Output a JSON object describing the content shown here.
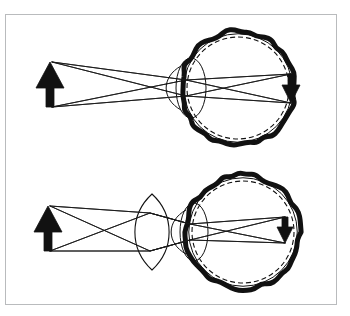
{
  "figure": {
    "title": "Optical ray diagram of the human eye: uncorrected hyperopia and convex-lens correction",
    "caption": "",
    "background_color": "#ffffff",
    "frame": {
      "stroke_color": "#b9bbbd",
      "stroke_width": 1,
      "x": 5,
      "y": 14,
      "width": 332,
      "height": 291
    },
    "ink_color": "#111111",
    "ray_color": "#1a1a1a",
    "dashed_color": "#111111"
  },
  "panels": [
    {
      "id": "panel-top",
      "name": "uncorrected-eye-panel",
      "label": "Uncorrected eye",
      "has_external_lens": false,
      "object_arrow": {
        "name": "object-arrow",
        "orientation": "upright",
        "tip_x": 50,
        "tip_y": 62,
        "base_x": 50,
        "base_y": 107,
        "head_half_width": 14,
        "head_height": 26,
        "shaft_half_width": 4,
        "color": "#111111"
      },
      "eyeball": {
        "name": "eyeball",
        "center_x": 238,
        "center_y": 88,
        "radius": 57,
        "sclera_thickness": 5,
        "sclera_color": "#111111",
        "retina_dash_inset": 6,
        "retina_dash_pattern": "5,3",
        "cornea_bulge_x": 181,
        "cornea_bulge_rx": 9,
        "cornea_bulge_ry": 22
      },
      "crystalline_lens": {
        "name": "crystalline-lens",
        "center_x": 191,
        "center_y": 88,
        "rx": 15,
        "ry": 30
      },
      "image_arrow": {
        "name": "image-arrow",
        "orientation": "inverted",
        "tip_x": 291,
        "tip_y": 103,
        "base_x": 291,
        "base_y": 74,
        "head_half_width": 9,
        "head_height": 18,
        "shaft_half_width": 3,
        "color": "#111111"
      },
      "rays": [
        {
          "name": "ray-from-tip-upper",
          "points": [
            [
              52,
              62
            ],
            [
              186,
              80
            ],
            [
              291,
              103
            ]
          ]
        },
        {
          "name": "ray-from-tip-lower",
          "points": [
            [
              52,
              62
            ],
            [
              186,
              96
            ],
            [
              291,
              103
            ]
          ]
        },
        {
          "name": "ray-from-base-upper",
          "points": [
            [
              52,
              107
            ],
            [
              186,
              80
            ],
            [
              291,
              74
            ]
          ]
        },
        {
          "name": "ray-from-base-lower",
          "points": [
            [
              52,
              107
            ],
            [
              186,
              96
            ],
            [
              291,
              74
            ]
          ]
        }
      ]
    },
    {
      "id": "panel-bottom",
      "name": "corrected-eye-panel",
      "label": "Eye corrected by convex spectacle lens",
      "has_external_lens": true,
      "object_arrow": {
        "name": "object-arrow",
        "orientation": "upright",
        "tip_x": 48,
        "tip_y": 206,
        "base_x": 48,
        "base_y": 251,
        "head_half_width": 14,
        "head_height": 26,
        "shaft_half_width": 4,
        "color": "#111111"
      },
      "external_lens": {
        "name": "corrective-convex-lens",
        "center_x": 152,
        "center_y": 232,
        "rx": 12,
        "ry": 38,
        "type": "biconvex"
      },
      "eyeball": {
        "name": "eyeball",
        "center_x": 243,
        "center_y": 232,
        "radius": 57,
        "sclera_thickness": 5,
        "sclera_color": "#111111",
        "retina_dash_inset": 6,
        "retina_dash_pattern": "5,3",
        "cornea_bulge_x": 186,
        "cornea_bulge_rx": 9,
        "cornea_bulge_ry": 22
      },
      "crystalline_lens": {
        "name": "crystalline-lens",
        "center_x": 194,
        "center_y": 232,
        "rx": 14,
        "ry": 29
      },
      "image_arrow": {
        "name": "image-arrow",
        "orientation": "inverted",
        "tip_x": 285,
        "tip_y": 243,
        "base_x": 285,
        "base_y": 217,
        "head_half_width": 8,
        "head_height": 16,
        "shaft_half_width": 3,
        "color": "#111111"
      },
      "rays": [
        {
          "name": "ray-from-tip-upper",
          "points": [
            [
              50,
              206
            ],
            [
              150,
              213
            ],
            [
              190,
              224
            ],
            [
              285,
              243
            ]
          ]
        },
        {
          "name": "ray-from-tip-lower",
          "points": [
            [
              50,
              206
            ],
            [
              150,
              251
            ],
            [
              190,
              240
            ],
            [
              285,
              243
            ]
          ]
        },
        {
          "name": "ray-from-base-upper",
          "points": [
            [
              50,
              251
            ],
            [
              150,
              213
            ],
            [
              190,
              224
            ],
            [
              285,
              217
            ]
          ]
        },
        {
          "name": "ray-from-base-lower",
          "points": [
            [
              50,
              251
            ],
            [
              150,
              251
            ],
            [
              190,
              240
            ],
            [
              285,
              217
            ]
          ]
        }
      ]
    }
  ],
  "chart_data": {
    "type": "diagram",
    "subtype": "optical-ray-diagram",
    "panel_count": 2,
    "panels": [
      {
        "index": 0,
        "position": "top",
        "description": "Light rays from an upright object arrow enter the eye, are refracted by the cornea and crystalline lens, cross, and form an inverted image at the retina.",
        "object": "upright arrow (left)",
        "image": "inverted arrow (right, at retina)",
        "optical_elements": [
          "cornea",
          "crystalline lens",
          "retina"
        ],
        "corrective_lens": false
      },
      {
        "index": 1,
        "position": "bottom",
        "description": "A biconvex spectacle lens placed before the eye pre-converges the rays; the cornea and crystalline lens then focus them to an inverted image at the retina.",
        "object": "upright arrow (left)",
        "image": "inverted arrow (right, at retina)",
        "optical_elements": [
          "convex spectacle lens",
          "cornea",
          "crystalline lens",
          "retina"
        ],
        "corrective_lens": true
      }
    ],
    "legend": [],
    "annotations": [],
    "xlabel": "",
    "ylabel": ""
  }
}
